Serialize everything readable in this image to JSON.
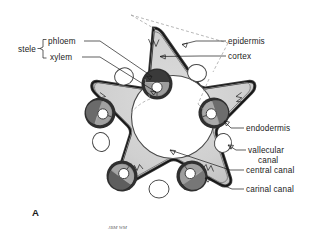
{
  "figure": {
    "panel_label": "A",
    "signature": "JBM WM"
  },
  "labels": {
    "stele": "stele",
    "phloem": "phloem",
    "xylem": "xylem",
    "epidermis": "epidermis",
    "cortex": "cortex",
    "endodermis": "endodermis",
    "vallecular_line1": "vallecular",
    "vallecular_line2": "canal",
    "central_canal": "central canal",
    "carinal_canal": "carinal canal"
  },
  "colors": {
    "outline": "#2b2b2b",
    "epidermis_band": "#555555",
    "cortex_fill": "#d2d2d2",
    "bundle_ring": "#3c3c3c",
    "bundle_inner": "#a8a8a8",
    "canal_white": "#ffffff",
    "dashed_guide": "#9a9a9a",
    "text": "#1a1a1a"
  },
  "structures": [
    {
      "name": "epidermis",
      "count": 1,
      "note": "outer dark double band of star outline"
    },
    {
      "name": "cortex",
      "count": 1,
      "note": "light grey ground tissue between epidermis and stele"
    },
    {
      "name": "stele",
      "count": 1,
      "note": "bracket grouping phloem and xylem"
    },
    {
      "name": "vascular-bundle",
      "count": 5,
      "note": "dark ring with phloem/xylem and carinal canal"
    },
    {
      "name": "vallecular-canal",
      "count": 5,
      "note": "white ovals between bundles"
    },
    {
      "name": "central-canal",
      "count": 1,
      "note": "large white pith cavity at centre"
    },
    {
      "name": "carinal-canal",
      "count": 5,
      "note": "small white circle inside each bundle"
    },
    {
      "name": "endodermis",
      "count": 5,
      "note": "dark ring bounding each bundle"
    }
  ]
}
